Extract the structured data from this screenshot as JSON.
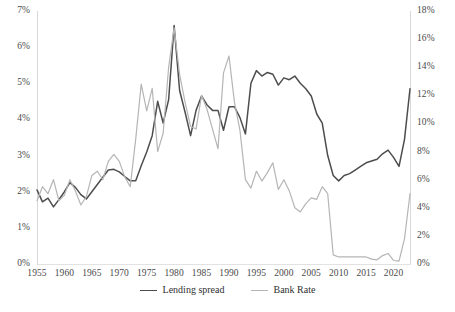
{
  "chart_data": {
    "type": "line",
    "title": "",
    "xlabel": "",
    "ylabel": "",
    "grid": false,
    "legend_position": "bottom-center",
    "x": [
      1955,
      1956,
      1957,
      1958,
      1959,
      1960,
      1961,
      1962,
      1963,
      1964,
      1965,
      1966,
      1967,
      1968,
      1969,
      1970,
      1971,
      1972,
      1973,
      1974,
      1975,
      1976,
      1977,
      1978,
      1979,
      1980,
      1981,
      1982,
      1983,
      1984,
      1985,
      1986,
      1987,
      1988,
      1989,
      1990,
      1991,
      1992,
      1993,
      1994,
      1995,
      1996,
      1997,
      1998,
      1999,
      2000,
      2001,
      2002,
      2003,
      2004,
      2005,
      2006,
      2007,
      2008,
      2009,
      2010,
      2011,
      2012,
      2013,
      2014,
      2015,
      2016,
      2017,
      2018,
      2019,
      2020,
      2021,
      2022,
      2023
    ],
    "x_tick_labels": [
      "1955",
      "1960",
      "1965",
      "1970",
      "1975",
      "1980",
      "1985",
      "1990",
      "1995",
      "2000",
      "2005",
      "2010",
      "2015",
      "2020"
    ],
    "x_ticks": [
      1955,
      1960,
      1965,
      1970,
      1975,
      1980,
      1985,
      1990,
      1995,
      2000,
      2005,
      2010,
      2015,
      2020
    ],
    "axes": {
      "left": {
        "label": "",
        "tick_labels": [
          "0%",
          "1%",
          "2%",
          "3%",
          "4%",
          "5%",
          "6%",
          "7%"
        ],
        "ticks": [
          0,
          1,
          2,
          3,
          4,
          5,
          6,
          7
        ],
        "lim": [
          0,
          7
        ],
        "unit": "%"
      },
      "right": {
        "label": "",
        "tick_labels": [
          "0%",
          "2%",
          "4%",
          "6%",
          "8%",
          "10%",
          "12%",
          "14%",
          "16%",
          "18%"
        ],
        "ticks": [
          0,
          2,
          4,
          6,
          8,
          10,
          12,
          14,
          16,
          18
        ],
        "lim": [
          0,
          18
        ],
        "unit": "%"
      }
    },
    "series": [
      {
        "name": "Lending spread",
        "axis": "left",
        "color": "#4d4d4d",
        "width": 1.5,
        "values": [
          2.05,
          1.72,
          1.82,
          1.58,
          1.78,
          2.0,
          2.25,
          2.12,
          1.92,
          1.8,
          2.0,
          2.2,
          2.4,
          2.6,
          2.62,
          2.55,
          2.42,
          2.3,
          2.3,
          2.72,
          3.1,
          3.55,
          4.5,
          3.9,
          4.55,
          6.6,
          4.8,
          4.2,
          3.55,
          4.25,
          4.65,
          4.4,
          4.25,
          4.25,
          3.7,
          4.35,
          4.35,
          4.05,
          3.6,
          5.0,
          5.35,
          5.2,
          5.3,
          5.25,
          4.95,
          5.15,
          5.1,
          5.2,
          5.0,
          4.85,
          4.65,
          4.15,
          3.9,
          3.0,
          2.45,
          2.3,
          2.45,
          2.5,
          2.6,
          2.7,
          2.8,
          2.85,
          2.9,
          3.05,
          3.15,
          2.95,
          2.7,
          3.45,
          4.85
        ]
      },
      {
        "name": "Bank Rate",
        "axis": "right",
        "color": "#b5b5b5",
        "width": 1.2,
        "values": [
          4.5,
          5.5,
          5.0,
          6.0,
          4.5,
          4.9,
          6.0,
          5.2,
          4.2,
          4.8,
          6.3,
          6.6,
          6.0,
          7.3,
          7.8,
          7.3,
          6.2,
          5.5,
          8.9,
          12.8,
          10.9,
          12.5,
          8.0,
          9.3,
          14.0,
          16.8,
          13.5,
          11.5,
          9.8,
          9.6,
          12.0,
          11.0,
          9.6,
          8.2,
          13.6,
          14.8,
          11.5,
          9.5,
          6.0,
          5.4,
          6.6,
          5.9,
          6.5,
          7.2,
          5.3,
          6.0,
          5.2,
          4.0,
          3.7,
          4.3,
          4.7,
          4.6,
          5.5,
          5.0,
          0.65,
          0.5,
          0.5,
          0.5,
          0.5,
          0.5,
          0.5,
          0.35,
          0.3,
          0.6,
          0.75,
          0.25,
          0.2,
          1.8,
          5.0
        ]
      }
    ]
  },
  "legend": {
    "items": [
      {
        "label": "Lending spread",
        "color": "#4d4d4d"
      },
      {
        "label": "Bank Rate",
        "color": "#b5b5b5"
      }
    ]
  }
}
